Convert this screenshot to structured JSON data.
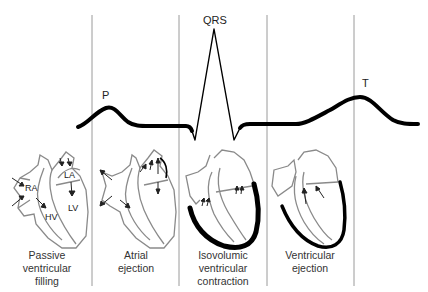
{
  "diagram": {
    "title": "",
    "wave_labels": {
      "p": "P",
      "qrs": "QRS",
      "t": "T"
    },
    "phases": [
      {
        "caption_lines": [
          "Passive",
          "ventricular",
          "filling"
        ],
        "heart_labels": [
          "RA",
          "LA",
          "HV",
          "LV"
        ]
      },
      {
        "caption_lines": [
          "Atrial",
          "ejection"
        ]
      },
      {
        "caption_lines": [
          "Isovolumic",
          "ventricular",
          "contraction"
        ]
      },
      {
        "caption_lines": [
          "Ventricular",
          "ejection"
        ]
      }
    ],
    "colors": {
      "ecg_trace": "#000000",
      "divider": "#9a9a9a",
      "heart_outline": "#8a8a8a",
      "contracting_wall": "#000000",
      "text": "#333333"
    }
  }
}
